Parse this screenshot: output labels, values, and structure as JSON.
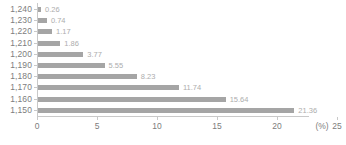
{
  "chart_data": {
    "type": "bar",
    "orientation": "horizontal",
    "title": "",
    "subtitle": "",
    "xlabel": "(%)",
    "ylabel": "",
    "categories": [
      "1,240",
      "1,230",
      "1,220",
      "1,210",
      "1,200",
      "1,190",
      "1,180",
      "1,170",
      "1,160",
      "1,150"
    ],
    "values": [
      0.26,
      0.74,
      1.17,
      1.86,
      3.77,
      5.55,
      8.23,
      11.74,
      15.64,
      21.36
    ],
    "value_labels": [
      "0.26",
      "0.74",
      "1.17",
      "1.86",
      "3.77",
      "5.55",
      "8.23",
      "11.74",
      "15.64",
      "21.36"
    ],
    "xlim": [
      0,
      25
    ],
    "xticks": [
      0,
      5,
      10,
      15,
      20,
      25
    ],
    "xtick_labels": [
      "0",
      "5",
      "10",
      "15",
      "20",
      "25"
    ],
    "unit_label": "(%)",
    "grid": false,
    "legend": null,
    "bar_color": "#a5a5a5",
    "axis_color": "#c9c9c9",
    "label_color": "#7d7d7d",
    "value_label_color": "#adadad"
  }
}
